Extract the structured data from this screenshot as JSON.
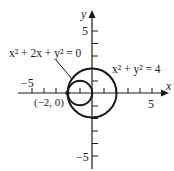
{
  "diagram": {
    "type": "coordinate-plane-circles",
    "axes": {
      "x_label": "x",
      "y_label": "y",
      "x_ticks": {
        "min": -5,
        "max": 5,
        "step": 1
      },
      "y_ticks": {
        "min": -5,
        "max": 5,
        "step": 1
      },
      "tick_labels": {
        "x_neg": "−5",
        "x_pos": "5",
        "y_pos": "5",
        "y_neg": "−5"
      }
    },
    "curves": [
      {
        "name": "small-circle",
        "equation": "x² + 2x + y² = 0",
        "center": [
          -1,
          0
        ],
        "radius": 1
      },
      {
        "name": "large-circle",
        "equation": "x² + y² = 4",
        "center": [
          0,
          0
        ],
        "radius": 2
      }
    ],
    "points": [
      {
        "label": "(−2, 0)",
        "coords": [
          -2,
          0
        ]
      }
    ],
    "labels": {
      "small_eq_base": "x",
      "small_eq": "x² + 2x + y² = 0",
      "large_eq": "x² + y² = 4",
      "point": "(−2, 0)"
    },
    "colors": {
      "stroke": "#1a1a1a",
      "background": "#ffffff"
    }
  }
}
